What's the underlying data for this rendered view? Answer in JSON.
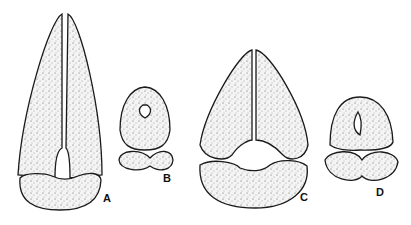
{
  "figure": {
    "panels": [
      {
        "label": "A",
        "description": "elongated two-lobed structure above a kidney-shaped base"
      },
      {
        "label": "B",
        "description": "small rounded structure with keyhole opening and crossed lower lobes"
      },
      {
        "label": "C",
        "description": "triangular two-lobed structure above a kidney-shaped base"
      },
      {
        "label": "D",
        "description": "rounded structure with slit opening and crossed lower lobes"
      }
    ],
    "colors": {
      "ink": "#1a1a1a",
      "background": "#ffffff"
    }
  }
}
